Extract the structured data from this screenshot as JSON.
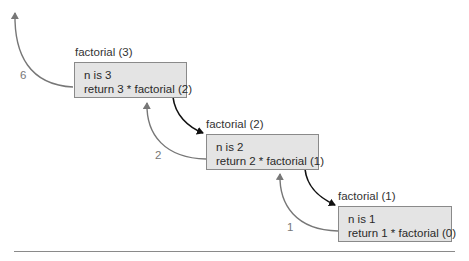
{
  "frames": [
    {
      "label": "factorial (3)",
      "line1": "n is 3",
      "line2": "return 3 * factorial (2)",
      "return_value": "6"
    },
    {
      "label": "factorial (2)",
      "line1": "n is 2",
      "line2": "return 2 * factorial (1)",
      "return_value": "2"
    },
    {
      "label": "factorial (1)",
      "line1": "n is 1",
      "line2": "return 1 * factorial (0)",
      "return_value": "1"
    }
  ],
  "colors": {
    "box_fill": "#e4e4e4",
    "box_border": "#8a8a8a",
    "call_arrow": "#111111",
    "return_arrow": "#777777"
  }
}
